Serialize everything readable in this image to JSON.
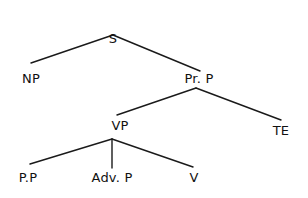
{
  "diagram": {
    "type": "syntax-tree",
    "colors": {
      "background": "#ffffff",
      "line": "#1a1a1a",
      "text": "#111111"
    },
    "nodes": [
      {
        "id": "S",
        "label": "S",
        "x": 113,
        "y": 32
      },
      {
        "id": "NP",
        "label": "NP",
        "x": 31,
        "y": 72
      },
      {
        "id": "PrP",
        "label": "Pr. P",
        "x": 199,
        "y": 72
      },
      {
        "id": "VP",
        "label": "VP",
        "x": 120,
        "y": 119
      },
      {
        "id": "TE",
        "label": "TE",
        "x": 281,
        "y": 124
      },
      {
        "id": "PP",
        "label": "P.P",
        "x": 28,
        "y": 171
      },
      {
        "id": "AdvP",
        "label": "Adv. P",
        "x": 112,
        "y": 171
      },
      {
        "id": "V",
        "label": "V",
        "x": 194,
        "y": 171
      }
    ],
    "edges": [
      {
        "from": "S",
        "to": "NP",
        "x1": 113,
        "y1": 35,
        "x2": 31,
        "y2": 63
      },
      {
        "from": "S",
        "to": "PrP",
        "x1": 113,
        "y1": 35,
        "x2": 200,
        "y2": 71
      },
      {
        "from": "PrP",
        "to": "VP",
        "x1": 196,
        "y1": 88,
        "x2": 117,
        "y2": 115
      },
      {
        "from": "PrP",
        "to": "TE",
        "x1": 196,
        "y1": 88,
        "x2": 281,
        "y2": 120
      },
      {
        "from": "VP",
        "to": "PP",
        "x1": 112,
        "y1": 139,
        "x2": 30,
        "y2": 164
      },
      {
        "from": "VP",
        "to": "AdvP",
        "x1": 112,
        "y1": 139,
        "x2": 112,
        "y2": 168
      },
      {
        "from": "VP",
        "to": "V",
        "x1": 112,
        "y1": 139,
        "x2": 193,
        "y2": 167
      }
    ]
  }
}
